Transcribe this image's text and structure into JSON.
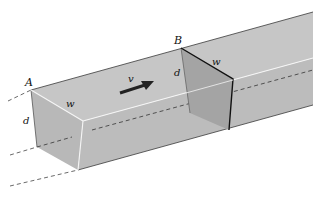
{
  "diagram": {
    "labels": {
      "point_a": "A",
      "point_b": "B",
      "velocity": "v",
      "width_front": "w",
      "depth_front": "d",
      "width_section_b": "w",
      "depth_section_b": "d"
    },
    "colors": {
      "top_face": "#c4c4c4",
      "side_face": "#bdbdbd",
      "front_face": "#b9b9b9",
      "section_face": "#a3a3a3",
      "edge_highlight": "#f4f4f4",
      "outline": "#2a2a2a",
      "dashed": "#333333"
    }
  }
}
